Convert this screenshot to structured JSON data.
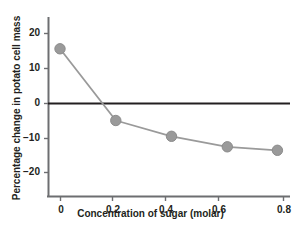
{
  "chart_data": {
    "type": "line",
    "title": "",
    "xlabel": "Concentration of sugar (molar)",
    "ylabel": "Percentage change in potato cell mass",
    "x": [
      0,
      0.2,
      0.4,
      0.6,
      0.78
    ],
    "values": [
      15.5,
      -5.0,
      -9.5,
      -12.5,
      -13.5
    ],
    "series": [
      {
        "name": "Percentage change in potato cell mass",
        "x": [
          0,
          0.2,
          0.4,
          0.6,
          0.78
        ],
        "values": [
          15.5,
          -5.0,
          -9.5,
          -12.5,
          -13.5
        ]
      }
    ],
    "xlim": [
      -0.03,
      0.83
    ],
    "ylim": [
      -25,
      25
    ],
    "xticks": [
      0,
      0.2,
      0.4,
      0.6,
      0.8
    ],
    "xtick_labels": [
      "0",
      "0.2",
      "0.4",
      "0.6",
      "0.8"
    ],
    "yticks": [
      20,
      10,
      0,
      -10,
      -20
    ],
    "ytick_labels": [
      "20",
      "10",
      "0",
      "−10",
      "−20"
    ],
    "grid": false,
    "legend": null,
    "zero_line": true,
    "marker": "circle",
    "colors": {
      "series_line": "#9a9a9a",
      "marker_fill": "#9a9a9a",
      "marker_edge": "#8c8c8c",
      "axis": "#6d6e71",
      "zero_line": "#231f20",
      "text": "#231f20",
      "background": "#ffffff"
    }
  },
  "axes": {
    "y_ticks": [
      {
        "label": "20",
        "y": 33
      },
      {
        "label": "10",
        "y": 68
      },
      {
        "label": "0",
        "y": 103
      },
      {
        "label": "−10",
        "y": 138
      },
      {
        "label": "−20",
        "y": 172
      }
    ],
    "x_ticks": [
      {
        "label": "0",
        "x": 60
      },
      {
        "label": "0.2",
        "x": 112
      },
      {
        "label": "0.4",
        "x": 165
      },
      {
        "label": "0.6",
        "x": 218
      },
      {
        "label": "0.8",
        "x": 283
      }
    ]
  }
}
